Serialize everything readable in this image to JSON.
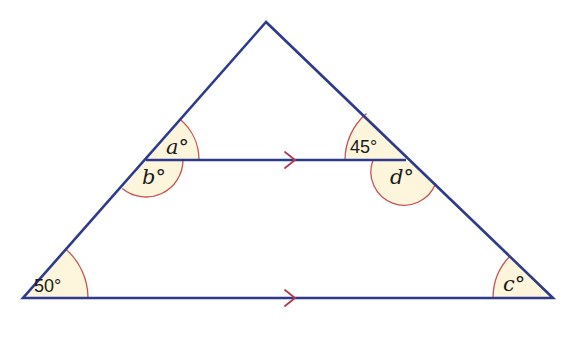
{
  "colors": {
    "line": "#2e3a8c",
    "angle_fill": "#fdf6dc",
    "angle_arc": "#c9514f",
    "arrow": "#b23a4a",
    "background": "#ffffff"
  },
  "vertices": {
    "apex": [
      266,
      22
    ],
    "bottom_left": [
      23,
      298
    ],
    "bottom_right": [
      553,
      298
    ],
    "mid_left": [
      146,
      160
    ],
    "mid_right": [
      406,
      160
    ]
  },
  "angles": {
    "a": {
      "label": "a°",
      "value": null
    },
    "b": {
      "label": "b°",
      "value": null
    },
    "forty_five": {
      "label": "45°",
      "value": 45
    },
    "d": {
      "label": "d°",
      "value": null
    },
    "fifty": {
      "label": "50°",
      "value": 50
    },
    "c": {
      "label": "c°",
      "value": null
    }
  },
  "parallel_marks": {
    "top_line": ">",
    "bottom_line": ">"
  }
}
